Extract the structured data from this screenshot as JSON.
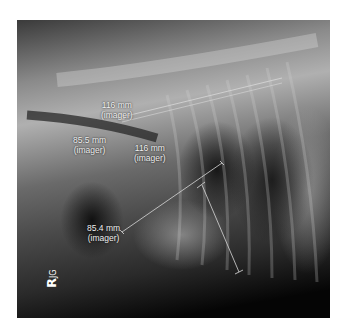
{
  "image": {
    "description": "Lateral thoracic radiograph with measurement overlays",
    "background_color": "#ffffff"
  },
  "measurements": [
    {
      "value": "116 mm",
      "unit_note": "(imager)"
    },
    {
      "value": "85.5 mm",
      "unit_note": "(imager)"
    },
    {
      "value": "116 mm",
      "unit_note": "(imager)"
    },
    {
      "value": "85.4 mm",
      "unit_note": "(imager)"
    }
  ],
  "marker": {
    "side": "R",
    "initials": "JG"
  },
  "colors": {
    "annotation_text": "#f0f0f0",
    "measurement_line": "#d8d8d8"
  }
}
